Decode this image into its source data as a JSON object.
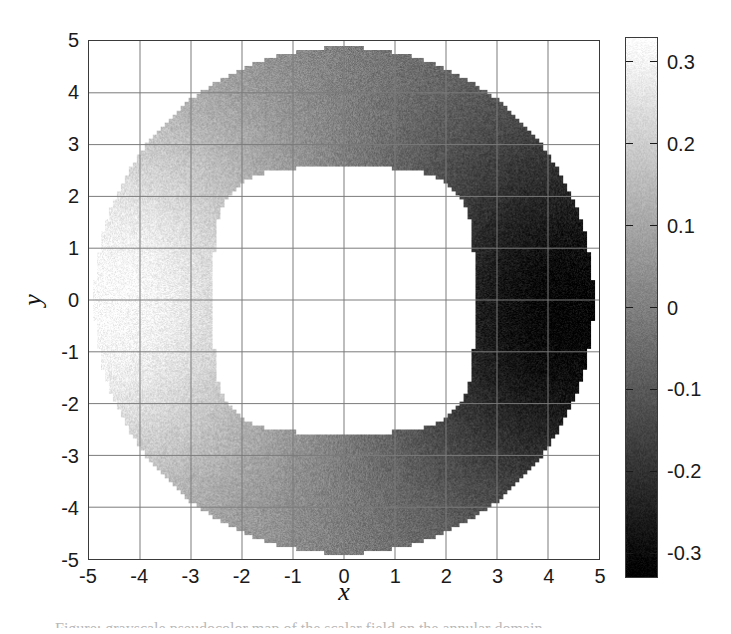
{
  "figure": {
    "background_color": "#ffffff",
    "axis_color": "#3a3a3a",
    "grid_color": "#7a7a7a",
    "text_color": "#1a1a1a"
  },
  "axes": {
    "xlabel": "x",
    "ylabel": "y",
    "xticks": [
      "-5",
      "-4",
      "-3",
      "-2",
      "-1",
      "0",
      "1",
      "2",
      "3",
      "4",
      "5"
    ],
    "yticks": [
      "5",
      "4",
      "3",
      "2",
      "1",
      "0",
      "-1",
      "-2",
      "-3",
      "-4",
      "-5"
    ],
    "xlim": [
      -5,
      5
    ],
    "ylim": [
      -5,
      5
    ],
    "grid": true
  },
  "colorbar": {
    "ticks": [
      "0.3",
      "0.2",
      "0.1",
      "0",
      "-0.1",
      "-0.2",
      "-0.3"
    ],
    "tick_values": [
      0.3,
      0.2,
      0.1,
      0,
      -0.1,
      -0.2,
      -0.3
    ],
    "vmin": -0.33,
    "vmax": 0.33,
    "colormap": "gray",
    "orientation": "vertical",
    "position": "right"
  },
  "caption": {
    "sliver_text": "Figure: grayscale pseudocolor map of the scalar field on the annular domain"
  },
  "chart_data": {
    "type": "heatmap",
    "title": "",
    "xlabel": "x",
    "ylabel": "y",
    "xlim": [
      -5,
      5
    ],
    "ylim": [
      -5,
      5
    ],
    "grid": true,
    "colormap": "gray",
    "colorbar_label": "",
    "vmin": -0.33,
    "vmax": 0.33,
    "domain": {
      "shape": "annulus",
      "outer_boundary": "circle",
      "outer_radius": 4.9,
      "inner_boundary": "superellipse",
      "inner_half_width": 2.55,
      "inner_exponent": 4.0,
      "masked_fill": "#ffffff",
      "pixelation_cells": 128
    },
    "field_model": {
      "description": "Dipole-like scalar field, positive lobe on the left, negative lobe on the right",
      "formula": "f(x,y) = A * cos(theta) * g(r), negated so that left side is bright",
      "amplitude": 0.33,
      "positive_peak": {
        "x": -4.2,
        "y": 0.0,
        "value": 0.33
      },
      "negative_peak": {
        "x": 4.0,
        "y": -0.3,
        "value": -0.33
      },
      "zero_contour": "vertical band near x = 0 (inside the hole)",
      "noise_amplitude": 0.035
    },
    "sampled_profile_along_y0": {
      "x": [
        -4.9,
        -4.5,
        -4.2,
        -3.8,
        -3.4,
        -3.0,
        -2.6,
        2.6,
        3.0,
        3.4,
        3.8,
        4.2,
        4.6,
        4.9
      ],
      "values": [
        0.23,
        0.31,
        0.33,
        0.3,
        0.25,
        0.19,
        0.13,
        -0.13,
        -0.19,
        -0.25,
        -0.3,
        -0.33,
        -0.29,
        -0.22
      ]
    },
    "sampled_profile_along_x0": {
      "y": [
        -4.9,
        -4.4,
        -3.9,
        -3.4,
        -2.9,
        -2.6,
        2.6,
        2.9,
        3.4,
        3.9,
        4.4,
        4.9
      ],
      "values": [
        0.01,
        0.01,
        0.01,
        0.0,
        0.0,
        0.0,
        0.0,
        0.0,
        0.0,
        0.01,
        0.01,
        0.01
      ]
    }
  }
}
